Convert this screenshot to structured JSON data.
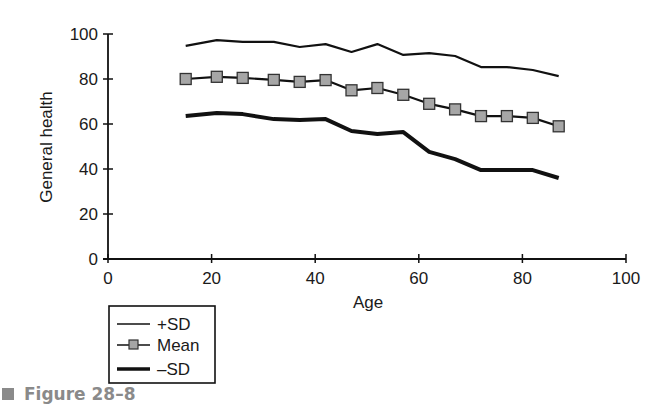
{
  "chart_data": {
    "type": "line",
    "title": "",
    "xlabel": "Age",
    "ylabel": "General health",
    "xlim": [
      0,
      100
    ],
    "ylim": [
      0,
      100
    ],
    "xticks": [
      0,
      20,
      40,
      60,
      80,
      100
    ],
    "yticks": [
      0,
      20,
      40,
      60,
      80,
      100
    ],
    "grid": false,
    "legend_position": "below-left",
    "x": [
      15,
      21,
      26,
      32,
      37,
      42,
      47,
      52,
      57,
      62,
      67,
      72,
      77,
      82,
      87
    ],
    "series": [
      {
        "name": "+SD",
        "style": "thin-line",
        "values": [
          94.7,
          97.3,
          96.5,
          96.5,
          94.2,
          95.5,
          92.0,
          95.5,
          90.7,
          91.5,
          90.2,
          85.3,
          85.3,
          84.0,
          81.3
        ]
      },
      {
        "name": "Mean",
        "style": "line-with-square-markers",
        "values": [
          80.0,
          81.0,
          80.5,
          79.6,
          78.7,
          79.5,
          75.0,
          76.0,
          73.0,
          69.0,
          66.5,
          63.5,
          63.5,
          62.7,
          59.0
        ]
      },
      {
        "name": "–SD",
        "style": "thick-line",
        "values": [
          63.5,
          64.9,
          64.4,
          62.2,
          61.8,
          62.2,
          56.9,
          55.6,
          56.4,
          47.6,
          44.4,
          39.5,
          39.5,
          39.5,
          36.0
        ]
      }
    ],
    "colors": {
      "line": "#111111",
      "marker_fill": "#a6a6a6",
      "marker_stroke": "#333333",
      "caption": "#8a8a8a"
    }
  },
  "legend": {
    "items": [
      {
        "label": "+SD"
      },
      {
        "label": "Mean"
      },
      {
        "label": "–SD"
      }
    ]
  },
  "caption": {
    "text": "Figure 28–8"
  }
}
